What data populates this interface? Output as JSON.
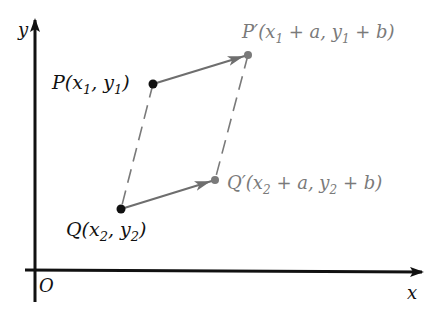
{
  "diagram": {
    "type": "vector-translation",
    "axes": {
      "x_label": "x",
      "y_label": "y",
      "origin_label": "O",
      "color": "#111111"
    },
    "points": {
      "P": {
        "name": "P",
        "label": "P(x",
        "sub1": "1",
        "mid": ", y",
        "sub2": "1",
        "end": ")",
        "color": "#111111"
      },
      "Q": {
        "name": "Q",
        "label": "Q(x",
        "sub1": "2",
        "mid": ", y",
        "sub2": "2",
        "end": ")",
        "color": "#111111"
      },
      "P_prime": {
        "name": "P′",
        "label": "P′(x",
        "sub1": "1",
        "mid": " + a, y",
        "sub2": "1",
        "end": " + b)",
        "color": "#7a7a7a"
      },
      "Q_prime": {
        "name": "Q′",
        "label": "Q′(x",
        "sub1": "2",
        "mid": " + a, y",
        "sub2": "2",
        "end": " + b)",
        "color": "#7a7a7a"
      }
    },
    "vectors": [
      {
        "from": "P",
        "to": "P′",
        "style": "solid-arrow",
        "color": "#6e6e6e"
      },
      {
        "from": "Q",
        "to": "Q′",
        "style": "solid-arrow",
        "color": "#6e6e6e"
      }
    ],
    "dashed_segments": [
      {
        "from": "P",
        "to": "Q",
        "color": "#7a7a7a"
      },
      {
        "from": "P′",
        "to": "Q′",
        "color": "#7a7a7a"
      }
    ]
  }
}
